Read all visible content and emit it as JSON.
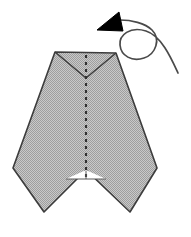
{
  "diagram": {
    "title": "Origami fold step diagram",
    "caption": "Shaded arrowhead-shaped paper model with a vertical valley-fold crease and a curved turn-over arrow",
    "canvas": {
      "width": 191,
      "height": 237,
      "background": "#ffffff"
    },
    "colors": {
      "paper_fill": "#b4b4b4",
      "paper_fill_light": "#c6c6c6",
      "outline": "#3c3c3c",
      "crease": "#303030",
      "arrow_black": "#000000",
      "arrow_line": "#4a4a4a",
      "background": "#ffffff"
    },
    "shapes": {
      "paper_body": {
        "name": "folded-paper-body",
        "label": "Shaded paper silhouette",
        "points": "55,52 116,53 157,168 130,212 86,170 44,212 13,168"
      },
      "top_valley_left": {
        "name": "top-valley-left-edge",
        "label": "Upper left bevel edge",
        "points": "55,52 86,78"
      },
      "top_valley_right": {
        "name": "top-valley-right-edge",
        "label": "Upper right bevel edge",
        "points": "116,53 86,78"
      },
      "bottom_notch_base": {
        "name": "bottom-notch-base-line",
        "label": "Horizontal base line of lower notch",
        "points": "66,179 106,179"
      },
      "center_crease": {
        "name": "center-crease-line",
        "label": "Vertical dashed valley fold crease",
        "x": 86,
        "y_top": 55,
        "y_bottom": 178,
        "dash": "3 4",
        "style": "dashed"
      },
      "lower_tick": {
        "name": "lower-crease-tick",
        "label": "Short crease tick inside lower notch",
        "x": 86,
        "y_top": 170,
        "y_bottom": 179
      }
    },
    "arrow": {
      "name": "turn-over-arrow",
      "label": "Turn over / rotate arrow with loop",
      "loop": {
        "cx": 135,
        "cy": 45,
        "r": 16
      },
      "tail_path": "M 178 73 C 172 60 162 36 146 31 C 130 26 119 35 120 45 C 121 56 132 62 144 58 C 156 54 161 39 152 30 C 145 23 131 20 120 20",
      "head": {
        "name": "arrowhead-triangle",
        "points": "119,12 97,30 123,31",
        "direction": "up-left",
        "fill": "#000000"
      }
    },
    "annotations": {
      "fold_type": "valley fold",
      "step_action": "turn over"
    }
  }
}
